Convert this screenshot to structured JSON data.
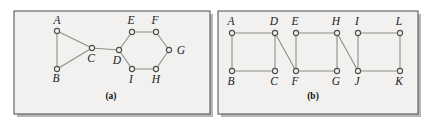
{
  "figure": {
    "background_color": "#ffffff",
    "panel_fill": "#f2f1ef",
    "panel_border_color": "#4a4a4a",
    "shadow_color": "#b9b7b3",
    "edge_color": "#8f8d8a",
    "node_stroke_color": "#4f4d4b",
    "node_fill_color": "#f2f1ef",
    "label_color": "#1a1a1a"
  },
  "panels": [
    {
      "id": "panel-a",
      "caption": "(a)",
      "caption_x": 111,
      "caption_y": 99,
      "frame": {
        "x": 14,
        "y": 11,
        "width": 196,
        "height": 103
      },
      "nodes": [
        {
          "id": "A",
          "label": "A",
          "x": 57,
          "y": 31,
          "label_x": 57,
          "label_y": 24
        },
        {
          "id": "B",
          "label": "B",
          "x": 57,
          "y": 69,
          "label_x": 56,
          "label_y": 82
        },
        {
          "id": "C",
          "label": "C",
          "x": 92,
          "y": 48,
          "label_x": 91,
          "label_y": 62
        },
        {
          "id": "D",
          "label": "D",
          "x": 119,
          "y": 50,
          "label_x": 117,
          "label_y": 64
        },
        {
          "id": "E",
          "label": "E",
          "x": 132,
          "y": 32,
          "label_x": 131,
          "label_y": 24
        },
        {
          "id": "F",
          "label": "F",
          "x": 156,
          "y": 32,
          "label_x": 155,
          "label_y": 24
        },
        {
          "id": "G",
          "label": "G",
          "x": 169,
          "y": 50,
          "label_x": 181,
          "label_y": 54
        },
        {
          "id": "H",
          "label": "H",
          "x": 156,
          "y": 69,
          "label_x": 156,
          "label_y": 83
        },
        {
          "id": "I",
          "label": "I",
          "x": 132,
          "y": 69,
          "label_x": 131,
          "label_y": 83
        }
      ],
      "edges": [
        {
          "from": "A",
          "to": "B"
        },
        {
          "from": "A",
          "to": "C"
        },
        {
          "from": "B",
          "to": "C"
        },
        {
          "from": "C",
          "to": "D"
        },
        {
          "from": "D",
          "to": "E"
        },
        {
          "from": "E",
          "to": "F"
        },
        {
          "from": "F",
          "to": "G"
        },
        {
          "from": "G",
          "to": "H"
        },
        {
          "from": "H",
          "to": "I"
        },
        {
          "from": "I",
          "to": "D"
        }
      ]
    },
    {
      "id": "panel-b",
      "caption": "(b)",
      "caption_x": 313,
      "caption_y": 99,
      "frame": {
        "x": 218,
        "y": 11,
        "width": 200,
        "height": 103
      },
      "nodes": [
        {
          "id": "A",
          "label": "A",
          "x": 232,
          "y": 33,
          "label_x": 231,
          "label_y": 25
        },
        {
          "id": "D",
          "label": "D",
          "x": 275,
          "y": 33,
          "label_x": 274,
          "label_y": 25
        },
        {
          "id": "E",
          "label": "E",
          "x": 296,
          "y": 33,
          "label_x": 295,
          "label_y": 25
        },
        {
          "id": "H",
          "label": "H",
          "x": 337,
          "y": 33,
          "label_x": 336,
          "label_y": 25
        },
        {
          "id": "I",
          "label": "I",
          "x": 358,
          "y": 33,
          "label_x": 357,
          "label_y": 25
        },
        {
          "id": "L",
          "label": "L",
          "x": 400,
          "y": 33,
          "label_x": 399,
          "label_y": 25
        },
        {
          "id": "B",
          "label": "B",
          "x": 232,
          "y": 71,
          "label_x": 231,
          "label_y": 85
        },
        {
          "id": "C",
          "label": "C",
          "x": 275,
          "y": 71,
          "label_x": 274,
          "label_y": 85
        },
        {
          "id": "F",
          "label": "F",
          "x": 296,
          "y": 71,
          "label_x": 295,
          "label_y": 85
        },
        {
          "id": "G",
          "label": "G",
          "x": 337,
          "y": 71,
          "label_x": 336,
          "label_y": 85
        },
        {
          "id": "J",
          "label": "J",
          "x": 358,
          "y": 71,
          "label_x": 357,
          "label_y": 85
        },
        {
          "id": "K",
          "label": "K",
          "x": 400,
          "y": 71,
          "label_x": 399,
          "label_y": 85
        }
      ],
      "edges": [
        {
          "from": "A",
          "to": "D"
        },
        {
          "from": "A",
          "to": "B"
        },
        {
          "from": "B",
          "to": "C"
        },
        {
          "from": "C",
          "to": "D"
        },
        {
          "from": "D",
          "to": "F"
        },
        {
          "from": "E",
          "to": "H"
        },
        {
          "from": "E",
          "to": "F"
        },
        {
          "from": "F",
          "to": "G"
        },
        {
          "from": "G",
          "to": "H"
        },
        {
          "from": "H",
          "to": "J"
        },
        {
          "from": "I",
          "to": "L"
        },
        {
          "from": "I",
          "to": "J"
        },
        {
          "from": "J",
          "to": "K"
        },
        {
          "from": "K",
          "to": "L"
        }
      ]
    }
  ],
  "chart_data": {
    "type": "diagram",
    "title": "",
    "subtitle": "",
    "graphs": [
      {
        "name": "(a)",
        "vertices": [
          "A",
          "B",
          "C",
          "D",
          "E",
          "F",
          "G",
          "H",
          "I"
        ],
        "vertex_count": 9,
        "edges": [
          [
            "A",
            "B"
          ],
          [
            "A",
            "C"
          ],
          [
            "B",
            "C"
          ],
          [
            "C",
            "D"
          ],
          [
            "D",
            "E"
          ],
          [
            "E",
            "F"
          ],
          [
            "F",
            "G"
          ],
          [
            "G",
            "H"
          ],
          [
            "H",
            "I"
          ],
          [
            "I",
            "D"
          ]
        ],
        "edge_count": 10,
        "structure": "triangle A-B-C joined by a bridge C-D to a hexagon D-E-F-G-H-I"
      },
      {
        "name": "(b)",
        "vertices": [
          "A",
          "B",
          "C",
          "D",
          "E",
          "F",
          "G",
          "H",
          "I",
          "J",
          "K",
          "L"
        ],
        "vertex_count": 12,
        "edges": [
          [
            "A",
            "D"
          ],
          [
            "A",
            "B"
          ],
          [
            "B",
            "C"
          ],
          [
            "C",
            "D"
          ],
          [
            "D",
            "F"
          ],
          [
            "E",
            "H"
          ],
          [
            "E",
            "F"
          ],
          [
            "F",
            "G"
          ],
          [
            "G",
            "H"
          ],
          [
            "H",
            "J"
          ],
          [
            "I",
            "L"
          ],
          [
            "I",
            "J"
          ],
          [
            "J",
            "K"
          ],
          [
            "K",
            "L"
          ]
        ],
        "edge_count": 14,
        "structure": "three 4-cycles A-D-C-B, E-H-G-F and I-L-K-J linked by diagonal edges D-F and H-J"
      }
    ]
  }
}
